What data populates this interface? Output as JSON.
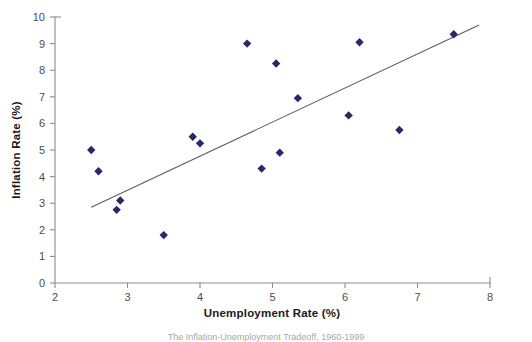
{
  "chart_data": {
    "type": "scatter",
    "title": "",
    "xlabel": "Unemployment Rate (%)",
    "ylabel": "Inflation Rate (%)",
    "xlim": [
      2,
      8
    ],
    "ylim": [
      0,
      10
    ],
    "xticks": [
      "2",
      "3",
      "4",
      "5",
      "6",
      "7",
      "8"
    ],
    "yticks": [
      "0",
      "1",
      "2",
      "3",
      "4",
      "5",
      "6",
      "7",
      "8",
      "9",
      "10"
    ],
    "grid": false,
    "legend": null,
    "marker_shape": "diamond",
    "marker_color": "#262a66",
    "trendline_color": "#5c5c5c",
    "axis_color": "#8c8c8c",
    "points": [
      {
        "x": 2.5,
        "y": 5.0
      },
      {
        "x": 2.6,
        "y": 4.2
      },
      {
        "x": 2.9,
        "y": 3.1
      },
      {
        "x": 2.85,
        "y": 2.75
      },
      {
        "x": 3.5,
        "y": 1.8
      },
      {
        "x": 3.9,
        "y": 5.5
      },
      {
        "x": 4.0,
        "y": 5.25
      },
      {
        "x": 4.65,
        "y": 9.0
      },
      {
        "x": 4.85,
        "y": 4.3
      },
      {
        "x": 5.05,
        "y": 8.25
      },
      {
        "x": 5.1,
        "y": 4.9
      },
      {
        "x": 5.35,
        "y": 6.95
      },
      {
        "x": 6.05,
        "y": 6.3
      },
      {
        "x": 6.2,
        "y": 9.05
      },
      {
        "x": 6.75,
        "y": 5.75
      },
      {
        "x": 7.5,
        "y": 9.35
      }
    ],
    "trendline": {
      "x1": 2.5,
      "y1": 2.85,
      "x2": 7.85,
      "y2": 9.7
    },
    "caption": "The Inflation-Unemployment Tradeoff, 1960-1999"
  }
}
